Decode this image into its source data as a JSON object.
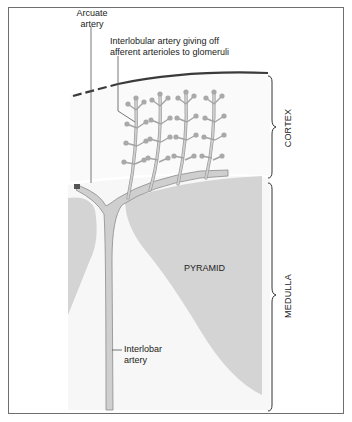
{
  "diagram": {
    "labels": {
      "arcuate_artery": {
        "line1": "Arcuate",
        "line2": "artery"
      },
      "interlobular_artery": {
        "line1": "Interlobular artery giving off",
        "line2": "afferent arterioles to glomeruli"
      },
      "pyramid": "PYRAMID",
      "interlobar_artery": {
        "line1": "Interlobar",
        "line2": "artery"
      },
      "cortex": "CORTEX",
      "medulla": "MEDULLA"
    },
    "colors": {
      "pyramid_fill": "#d4d4d4",
      "artery_fill": "#cfcfcf",
      "artery_stroke": "#8c8c8c",
      "glomerulus_fill": "#a9a9a9",
      "capsule_line": "#3a3a3a",
      "frame": "#6f6f6f",
      "background_tint": "#f6f6f6"
    }
  }
}
